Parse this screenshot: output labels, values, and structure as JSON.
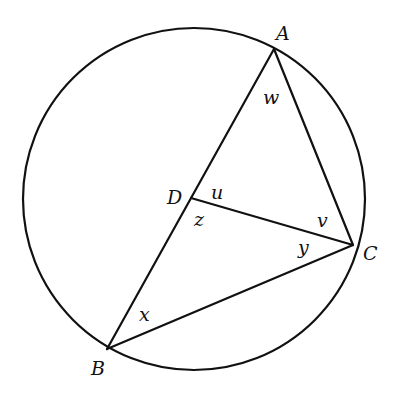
{
  "diagram": {
    "type": "circle-geometry",
    "colors": {
      "stroke": "#111111",
      "background": "#ffffff"
    },
    "circle": {
      "cx": 194,
      "cy": 199,
      "r": 171
    },
    "points": {
      "A": {
        "label": "A",
        "x": 274,
        "y": 49,
        "label_x": 276,
        "label_y": 40
      },
      "B": {
        "label": "B",
        "x": 107,
        "y": 349,
        "label_x": 91,
        "label_y": 375
      },
      "C": {
        "label": "C",
        "x": 353,
        "y": 245,
        "label_x": 363,
        "label_y": 260
      },
      "D": {
        "label": "D",
        "x": 191,
        "y": 198,
        "label_x": 167,
        "label_y": 204
      }
    },
    "segments": [
      {
        "name": "segment-AB",
        "from": "A",
        "to": "B"
      },
      {
        "name": "segment-AC",
        "from": "A",
        "to": "C"
      },
      {
        "name": "segment-BC",
        "from": "B",
        "to": "C"
      },
      {
        "name": "segment-DC",
        "from": "D",
        "to": "C"
      }
    ],
    "angle_labels": [
      {
        "name": "angle-w",
        "label": "w",
        "at": "A",
        "x": 263,
        "y": 104
      },
      {
        "name": "angle-u",
        "label": "u",
        "at": "D",
        "x": 211,
        "y": 199
      },
      {
        "name": "angle-z",
        "label": "z",
        "at": "D",
        "x": 194,
        "y": 226
      },
      {
        "name": "angle-v",
        "label": "v",
        "at": "C",
        "x": 317,
        "y": 227
      },
      {
        "name": "angle-y",
        "label": "y",
        "at": "C",
        "x": 298,
        "y": 254
      },
      {
        "name": "angle-x",
        "label": "x",
        "at": "B",
        "x": 139,
        "y": 321
      }
    ]
  }
}
